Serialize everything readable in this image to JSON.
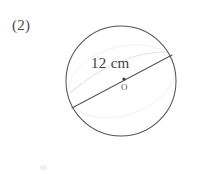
{
  "figure": {
    "item_number": "(2)",
    "measurement_label": "12 cm",
    "center_point_label": "O",
    "shape": "circle",
    "stroke_color": "#555555",
    "faint_arc_color": "#e2e2e2",
    "background_color": "#ffffff",
    "text_color": "#3f3f3f",
    "geometry": {
      "circle_center_x": 121,
      "circle_center_y": 81,
      "circle_radius": 55,
      "diameter_start_x": 72,
      "diameter_start_y": 108,
      "diameter_end_x": 172,
      "diameter_end_y": 55,
      "center_dot_x": 124,
      "center_dot_y": 79,
      "center_dot_radius": 1.6,
      "faint_arc_start_x": 70,
      "faint_arc_start_y": 93,
      "faint_arc_end_x": 168,
      "faint_arc_end_y": 52
    }
  }
}
